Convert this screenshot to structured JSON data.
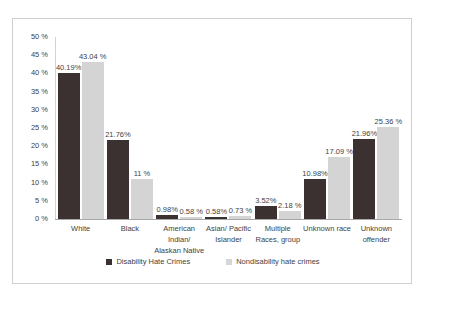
{
  "chart_data": {
    "type": "bar",
    "title": "",
    "subtitle": "",
    "xlabel": "",
    "ylabel": "",
    "ylim": [
      0,
      50
    ],
    "grid": false,
    "legend_position": "bottom",
    "y_ticks": [
      "0 %",
      "5 %",
      "10 %",
      "15 %",
      "20 %",
      "25 %",
      "30 %",
      "35 %",
      "40 %",
      "45 %",
      "50 %"
    ],
    "y_tick_values": [
      0,
      5,
      10,
      15,
      20,
      25,
      30,
      35,
      40,
      45,
      50
    ],
    "categories": [
      "White",
      "Black",
      "American\nIndian/\nAlaskan Native",
      "Asian/ Pacific\nIslander",
      "Multiple\nRaces,  group",
      "Unknown race",
      "Unknown\noffender"
    ],
    "series": [
      {
        "name": "Disability Hate Crimes",
        "color": "#3b3130",
        "values": [
          40.19,
          21.76,
          0.98,
          0.58,
          3.52,
          10.98,
          21.96
        ],
        "labels": [
          "40.19%",
          "21.76%",
          "0.98%",
          "0.58%",
          "3.52%",
          "10.98%",
          "21.96%"
        ]
      },
      {
        "name": "Nondisability hate crimes",
        "color": "#d4d4d4",
        "values": [
          43.04,
          11.0,
          0.58,
          0.73,
          2.18,
          17.09,
          25.36
        ],
        "labels": [
          "43.04 %",
          "11 %",
          "0.58 %",
          "0.73 %",
          "2.18 %",
          "17.09 %",
          "25.36 %"
        ]
      }
    ]
  },
  "legend": {
    "items": [
      {
        "label": "Disability Hate Crimes"
      },
      {
        "label": "Nondisability hate crimes"
      }
    ]
  }
}
